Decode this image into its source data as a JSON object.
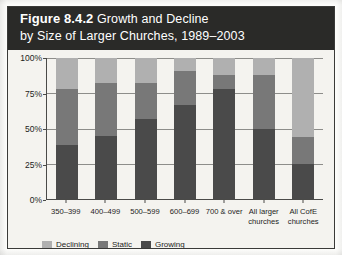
{
  "figure": {
    "number": "Figure 8.4.2",
    "title_line1": "Growth and Decline",
    "title_line2": "by Size of Larger Churches, 1989–2003"
  },
  "colors": {
    "declining": "#b0b0b0",
    "static": "#787878",
    "growing": "#4a4a4a",
    "band_background": "#2a2a28",
    "band_text": "#ffffff",
    "chart_background": "#f4f3ef",
    "axis": "#4a4a48",
    "gridline": "#8d8d8a"
  },
  "chart_data": {
    "type": "bar",
    "stacked": true,
    "stack_total": 100,
    "title": "Figure 8.4.2 Growth and Decline by Size of Larger Churches, 1989–2003",
    "xlabel": "",
    "ylabel": "",
    "ylim": [
      0,
      100
    ],
    "yticks": [
      0,
      25,
      50,
      75,
      100
    ],
    "ytick_labels": [
      "0%",
      "25%",
      "50%",
      "75%",
      "100%"
    ],
    "grid": true,
    "legend_position": "bottom-left",
    "categories": [
      "350–399",
      "400–499",
      "500–599",
      "600–699",
      "700 & over",
      "All larger\nchurches",
      "All CofE\nchurches"
    ],
    "series": [
      {
        "name": "Growing",
        "color": "#4a4a4a",
        "values": [
          38,
          45,
          57,
          67,
          78,
          50,
          25
        ]
      },
      {
        "name": "Static",
        "color": "#787878",
        "values": [
          40,
          37,
          25,
          24,
          10,
          38,
          19
        ]
      },
      {
        "name": "Declining",
        "color": "#b0b0b0",
        "values": [
          22,
          18,
          18,
          9,
          12,
          12,
          56
        ]
      }
    ],
    "stack_order_bottom_to_top": [
      "Growing",
      "Static",
      "Declining"
    ]
  },
  "legend": {
    "items": [
      {
        "label": "Declining",
        "color": "#b0b0b0"
      },
      {
        "label": "Static",
        "color": "#787878"
      },
      {
        "label": "Growing",
        "color": "#4a4a4a"
      }
    ]
  }
}
